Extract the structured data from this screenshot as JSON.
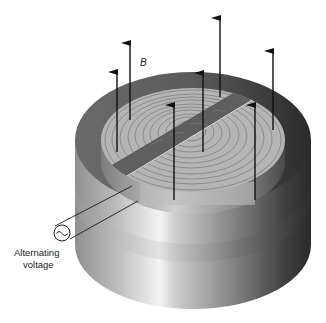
{
  "diagram": {
    "labels": {
      "field": "B",
      "source_line1": "Alternating",
      "source_line2": "voltage",
      "source_symbol": "~"
    },
    "components": [
      "outer-cylindrical-housing",
      "inner-flat-spiral-coil",
      "diagonal-slot",
      "field-arrows",
      "ac-voltage-source",
      "lead-wires"
    ],
    "field_arrow_count": 7,
    "colors": {
      "background": "#ffffff",
      "housing_light": "#d8d8d8",
      "housing_dark": "#3a3a3a",
      "coil_face": "#b3b3b3",
      "coil_rings": "#8a8a8a",
      "slot": "#5a5a5a",
      "arrow": "#111111"
    }
  }
}
